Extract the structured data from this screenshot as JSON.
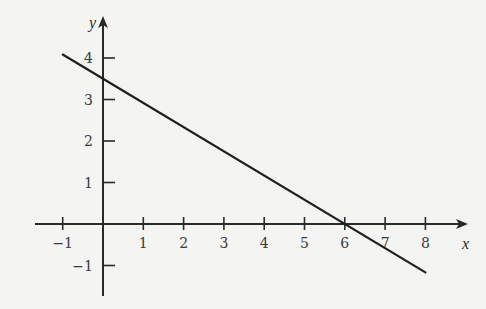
{
  "chart_data": {
    "type": "line",
    "title": "",
    "xlabel": "x",
    "ylabel": "y",
    "xlim": [
      -1.7,
      8.9
    ],
    "ylim": [
      -1.7,
      5.0
    ],
    "grid": false,
    "legend": null,
    "x_ticks": [
      -1,
      1,
      2,
      3,
      4,
      5,
      6,
      7,
      8
    ],
    "x_tick_labels": [
      "−1",
      "1",
      "2",
      "3",
      "4",
      "5",
      "6",
      "7",
      "8"
    ],
    "y_ticks": [
      -1,
      1,
      2,
      3,
      4
    ],
    "y_tick_labels": [
      "−1",
      "1",
      "2",
      "3",
      "4"
    ],
    "series": [
      {
        "name": "line",
        "equation": "y = -7/12 x + 3.5",
        "x": [
          -1,
          8
        ],
        "y": [
          4.083,
          -1.167
        ],
        "y_intercept": 3.5,
        "x_intercept": 6,
        "color": "#1e1e1e"
      }
    ]
  },
  "layout": {
    "origin_px": [
      103,
      224
    ],
    "px_per_unit_x": 40.3,
    "px_per_unit_y": 41.5,
    "x_axis_px": [
      35,
      468
    ],
    "y_axis_px": [
      16,
      296
    ],
    "colors": {
      "background": "#f4f4f2",
      "axis": "#2a2a2a",
      "line": "#1e1e1e",
      "text": "#3a3a3a"
    }
  }
}
